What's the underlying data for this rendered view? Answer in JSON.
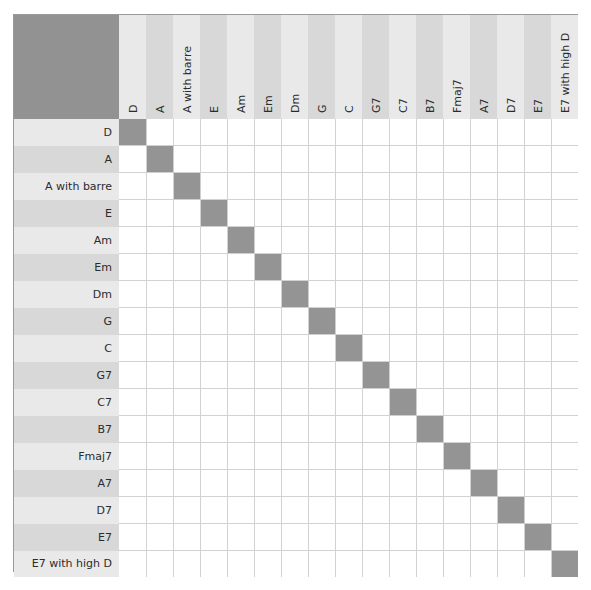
{
  "matrix": {
    "title": "Chord comparison matrix",
    "labels": [
      "D",
      "A",
      "A with barre",
      "E",
      "Am",
      "Em",
      "Dm",
      "G",
      "C",
      "G7",
      "C7",
      "B7",
      "Fmaj7",
      "A7",
      "D7",
      "E7",
      "E7 with high D"
    ],
    "column_headers": [
      "D",
      "A",
      "A with barre",
      "E",
      "Am",
      "Em",
      "Dm",
      "G",
      "C",
      "G7",
      "C7",
      "B7",
      "Fmaj7",
      "A7",
      "D7",
      "E7",
      "E7 with high D"
    ],
    "row_headers": [
      "D",
      "A",
      "A with barre",
      "E",
      "Am",
      "Em",
      "Dm",
      "G",
      "C",
      "G7",
      "C7",
      "B7",
      "Fmaj7",
      "A7",
      "D7",
      "E7",
      "E7 with high D"
    ],
    "rows": 17,
    "columns": 17,
    "cell_values": [
      [
        "x",
        "",
        "",
        "",
        "",
        "",
        "",
        "",
        "",
        "",
        "",
        "",
        "",
        "",
        "",
        "",
        ""
      ],
      [
        "",
        "x",
        "",
        "",
        "",
        "",
        "",
        "",
        "",
        "",
        "",
        "",
        "",
        "",
        "",
        "",
        ""
      ],
      [
        "",
        "",
        "x",
        "",
        "",
        "",
        "",
        "",
        "",
        "",
        "",
        "",
        "",
        "",
        "",
        "",
        ""
      ],
      [
        "",
        "",
        "",
        "x",
        "",
        "",
        "",
        "",
        "",
        "",
        "",
        "",
        "",
        "",
        "",
        "",
        ""
      ],
      [
        "",
        "",
        "",
        "",
        "x",
        "",
        "",
        "",
        "",
        "",
        "",
        "",
        "",
        "",
        "",
        "",
        ""
      ],
      [
        "",
        "",
        "",
        "",
        "",
        "x",
        "",
        "",
        "",
        "",
        "",
        "",
        "",
        "",
        "",
        "",
        ""
      ],
      [
        "",
        "",
        "",
        "",
        "",
        "",
        "x",
        "",
        "",
        "",
        "",
        "",
        "",
        "",
        "",
        "",
        ""
      ],
      [
        "",
        "",
        "",
        "",
        "",
        "",
        "",
        "x",
        "",
        "",
        "",
        "",
        "",
        "",
        "",
        "",
        ""
      ],
      [
        "",
        "",
        "",
        "",
        "",
        "",
        "",
        "",
        "x",
        "",
        "",
        "",
        "",
        "",
        "",
        "",
        ""
      ],
      [
        "",
        "",
        "",
        "",
        "",
        "",
        "",
        "",
        "",
        "x",
        "",
        "",
        "",
        "",
        "",
        "",
        ""
      ],
      [
        "",
        "",
        "",
        "",
        "",
        "",
        "",
        "",
        "",
        "",
        "x",
        "",
        "",
        "",
        "",
        "",
        ""
      ],
      [
        "",
        "",
        "",
        "",
        "",
        "",
        "",
        "",
        "",
        "",
        "",
        "x",
        "",
        "",
        "",
        "",
        ""
      ],
      [
        "",
        "",
        "",
        "",
        "",
        "",
        "",
        "",
        "",
        "",
        "",
        "",
        "x",
        "",
        "",
        "",
        ""
      ],
      [
        "",
        "",
        "",
        "",
        "",
        "",
        "",
        "",
        "",
        "",
        "",
        "",
        "",
        "x",
        "",
        "",
        ""
      ],
      [
        "",
        "",
        "",
        "",
        "",
        "",
        "",
        "",
        "",
        "",
        "",
        "",
        "",
        "",
        "x",
        "",
        ""
      ],
      [
        "",
        "",
        "",
        "",
        "",
        "",
        "",
        "",
        "",
        "",
        "",
        "",
        "",
        "",
        "",
        "x",
        ""
      ],
      [
        "",
        "",
        "",
        "",
        "",
        "",
        "",
        "",
        "",
        "",
        "",
        "",
        "",
        "",
        "",
        "",
        "x"
      ]
    ],
    "colors": {
      "corner_block": "#929292",
      "diagonal_cell": "#949494",
      "header_stripe_light": "#e9e9e9",
      "header_stripe_dark": "#d8d8d8",
      "cell_background": "#ffffff",
      "gridline": "#d2d2d2",
      "outer_border": "#9a9a9a",
      "text": "#2b2b2b"
    }
  }
}
